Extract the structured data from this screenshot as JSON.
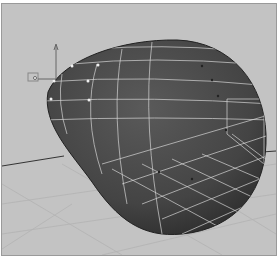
{
  "viewport": {
    "background": "#c3c3c3",
    "mesh_color": "#4a4a4a",
    "wire_color": "#d8d8d8",
    "grid_color": "#b0b0b0",
    "object": "egg-shaped polygon mesh with selected edge loops",
    "manipulator": "move-tool-gizmo"
  }
}
